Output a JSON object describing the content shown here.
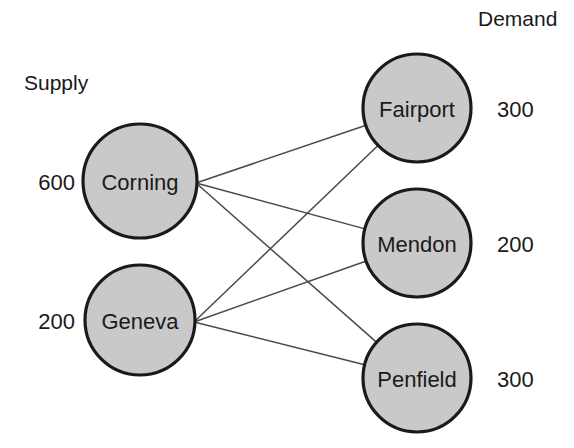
{
  "chart_data": {
    "type": "diagram",
    "diagram_kind": "bipartite-transportation-network",
    "title": "",
    "headings": {
      "supply": "Supply",
      "demand": "Demand"
    },
    "supply_nodes": [
      {
        "id": "corning",
        "label": "Corning",
        "value": "600",
        "cx": 140,
        "cy": 181,
        "r": 57
      },
      {
        "id": "geneva",
        "label": "Geneva",
        "value": "200",
        "cx": 140,
        "cy": 320,
        "r": 55
      }
    ],
    "demand_nodes": [
      {
        "id": "fairport",
        "label": "Fairport",
        "value": "300",
        "cx": 417,
        "cy": 108,
        "r": 54
      },
      {
        "id": "mendon",
        "label": "Mendon",
        "value": "200",
        "cx": 417,
        "cy": 243,
        "r": 54
      },
      {
        "id": "penfield",
        "label": "Penfield",
        "value": "300",
        "cx": 417,
        "cy": 378,
        "r": 54
      }
    ],
    "edges": [
      {
        "from": "corning",
        "to": "fairport"
      },
      {
        "from": "corning",
        "to": "mendon"
      },
      {
        "from": "corning",
        "to": "penfield"
      },
      {
        "from": "geneva",
        "to": "fairport"
      },
      {
        "from": "geneva",
        "to": "mendon"
      },
      {
        "from": "geneva",
        "to": "penfield"
      }
    ],
    "colors": {
      "node_fill": "#c9c9c9",
      "node_stroke": "#1a1a1a",
      "edge_stroke": "#4a4a4a",
      "text": "#1a1a1a",
      "background": "#ffffff"
    },
    "label_positions": {
      "supply_heading": {
        "x": 24,
        "y": 82
      },
      "demand_heading": {
        "x": 478,
        "y": 18
      },
      "supply_value_x": 75,
      "demand_value_x": 497
    }
  }
}
